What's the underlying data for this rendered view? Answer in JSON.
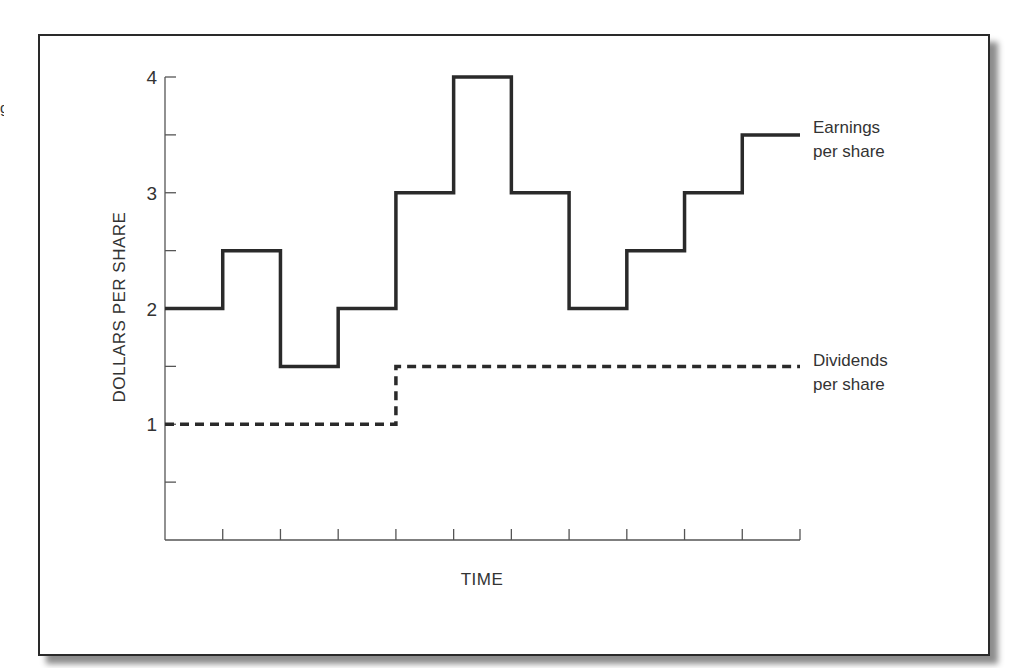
{
  "edge_fragment": "g",
  "chart_data": {
    "type": "line",
    "step": true,
    "title": "",
    "xlabel": "TIME",
    "ylabel": "DOLLARS PER SHARE",
    "ylim": [
      0,
      4
    ],
    "yticks": [
      1,
      2,
      3,
      4
    ],
    "y_minor_ticks": [
      0.5,
      1.5,
      2.5,
      3.5
    ],
    "x_tick_count": 11,
    "x": [
      1,
      2,
      3,
      4,
      5,
      6,
      7,
      8,
      9,
      10,
      11
    ],
    "series": [
      {
        "name": "Earnings per share",
        "style": "solid",
        "values": [
          2,
          2.5,
          1.5,
          2,
          3,
          4,
          3,
          2,
          2.5,
          3,
          3.5
        ]
      },
      {
        "name": "Dividends per share",
        "style": "dashed",
        "values": [
          1,
          1,
          1,
          1,
          1.5,
          1.5,
          1.5,
          1.5,
          1.5,
          1.5,
          1.5
        ]
      }
    ],
    "legend": [
      {
        "line1": "Earnings",
        "line2": "per share"
      },
      {
        "line1": "Dividends",
        "line2": "per share"
      }
    ],
    "legend_position": "right, inline at series end",
    "grid": false
  },
  "colors": {
    "line": "#2a2a2a",
    "axis": "#555555",
    "text": "#333333"
  }
}
